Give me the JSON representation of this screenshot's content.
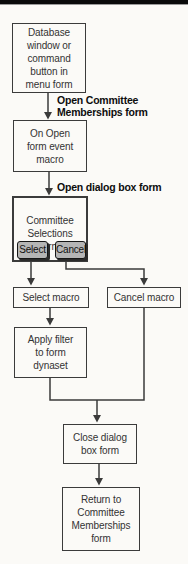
{
  "colors": {
    "background": "#fbfaf7",
    "line": "#3b3b3b",
    "box_border": "#3b3b3b",
    "text": "#333333",
    "edge_label_text": "#0d0d0d",
    "button_bg": "#b5b5b5",
    "button_border": "#161616",
    "button_shadow": "#2b2b2b",
    "top_rule": "#0a0a0a"
  },
  "flowchart": {
    "nodes": {
      "start": {
        "text": "Database\nwindow or\ncommand\nbutton in\nmenu form"
      },
      "on_open": {
        "text": "On Open\nform event\nmacro"
      },
      "dialog": {
        "text": "Committee\nSelections\nform",
        "buttons": {
          "select": "Select",
          "cancel": "Cancel"
        }
      },
      "select_macro": {
        "text": "Select macro"
      },
      "cancel_macro": {
        "text": "Cancel macro"
      },
      "apply_filter": {
        "text": "Apply filter\nto form\ndynaset"
      },
      "close_dialog": {
        "text": "Close dialog\nbox form"
      },
      "return_form": {
        "text": "Return to\nCommittee\nMemberships\nform"
      }
    },
    "edge_labels": {
      "open_memberships": "Open Committee\nMemberships form",
      "open_dialog": "Open dialog box form"
    }
  }
}
